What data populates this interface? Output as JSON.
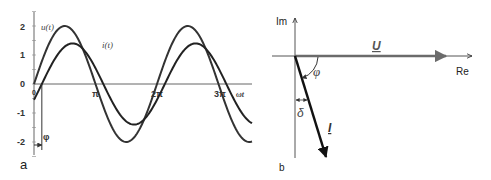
{
  "panel_a": {
    "label": "a",
    "u_label": "u(t)",
    "i_label": "i(t)",
    "x_axis_label": "ωt",
    "x_ticks": [
      "0",
      "π",
      "2π",
      "3π"
    ],
    "y_ticks": [
      "2",
      "1",
      "0",
      "-1",
      "-2"
    ],
    "phase_label": "φ",
    "u_amplitude": 2,
    "i_amplitude": 1.4,
    "phase_shift_rad": 0.4,
    "x_range_periods": 3.5
  },
  "panel_b": {
    "label": "b",
    "im_axis_label": "Im",
    "re_axis_label": "Re",
    "u_vector_label": "U",
    "i_vector_label": "I",
    "phi_label": "φ",
    "delta_label": "δ"
  },
  "colors": {
    "u_vector": "#6b6b6b",
    "i_vector": "#111111",
    "curves": "#333333",
    "axes": "#555555"
  }
}
